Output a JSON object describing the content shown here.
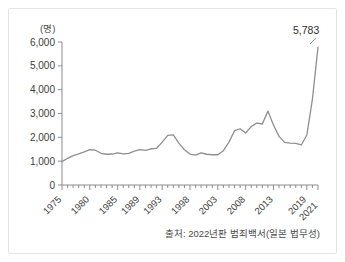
{
  "figure": {
    "unit_label": "(명)",
    "source_note": "출처: 2022년판 범죄백서(일본 법무성)",
    "end_value_label": "5,783",
    "line_color": "#8f8f8f",
    "axis_color": "#8c8c8c",
    "frame_color": "#e3e3e3",
    "background": "#ffffff"
  },
  "chart_data": {
    "type": "line",
    "title": "",
    "subtitle": "",
    "xlabel": "",
    "ylabel": "(명)",
    "ylim": [
      0,
      6000
    ],
    "xlim": [
      1975,
      2021
    ],
    "grid": false,
    "legend": "none",
    "y_ticks": [
      0,
      1000,
      2000,
      3000,
      4000,
      5000,
      6000
    ],
    "y_tick_labels": [
      "0",
      "1,000",
      "2,000",
      "3,000",
      "4,000",
      "5,000",
      "6,000"
    ],
    "x_tick_labels": [
      "1975",
      "1980",
      "1985",
      "1989",
      "1993",
      "1998",
      "2003",
      "2008",
      "2013",
      "2019",
      "2021"
    ],
    "x_tick_years": [
      1975,
      1980,
      1985,
      1989,
      1993,
      1998,
      2003,
      2008,
      2013,
      2019,
      2021
    ],
    "annotations": [
      {
        "x": 2021,
        "y": 5783,
        "text": "5,783"
      }
    ],
    "series": [
      {
        "name": "검거인원",
        "x": [
          1975,
          1976,
          1977,
          1978,
          1979,
          1980,
          1981,
          1982,
          1983,
          1984,
          1985,
          1986,
          1987,
          1988,
          1989,
          1990,
          1991,
          1992,
          1993,
          1994,
          1995,
          1996,
          1997,
          1998,
          1999,
          2000,
          2001,
          2002,
          2003,
          2004,
          2005,
          2006,
          2007,
          2008,
          2009,
          2010,
          2011,
          2012,
          2013,
          2014,
          2015,
          2016,
          2017,
          2018,
          2019,
          2020,
          2021
        ],
        "values": [
          980,
          1120,
          1230,
          1310,
          1390,
          1480,
          1460,
          1330,
          1290,
          1300,
          1350,
          1310,
          1330,
          1420,
          1480,
          1450,
          1520,
          1540,
          1800,
          2080,
          2100,
          1760,
          1480,
          1300,
          1250,
          1350,
          1290,
          1270,
          1270,
          1440,
          1800,
          2280,
          2360,
          2180,
          2450,
          2600,
          2560,
          3100,
          2520,
          2040,
          1790,
          1760,
          1750,
          1680,
          2100,
          3600,
          5783
        ]
      }
    ]
  }
}
